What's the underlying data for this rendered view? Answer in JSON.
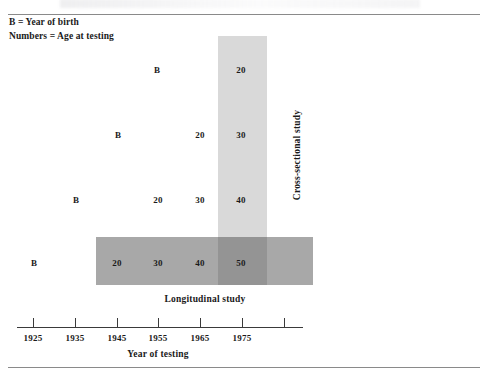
{
  "figure": {
    "legend": {
      "line1": "B = Year of birth",
      "line2": "Numbers = Age at testing"
    },
    "labels": {
      "cross_sectional": "Cross-sectional study",
      "longitudinal": "Longitudinal study",
      "axis_title": "Year of testing"
    }
  },
  "chart_data": {
    "type": "table",
    "title": "",
    "xlabel": "Year of testing",
    "ylabel": "",
    "legend_entries": [
      "B = Year of birth",
      "Numbers = Age at testing"
    ],
    "annotations": [
      "Cross-sectional study",
      "Longitudinal study"
    ],
    "axis": {
      "tick_labels": [
        "1925",
        "1935",
        "1945",
        "1955",
        "1965",
        "1975",
        ""
      ],
      "tick_values": [
        1925,
        1935,
        1945,
        1955,
        1965,
        1975,
        1985
      ],
      "xlim": [
        1920,
        1990
      ],
      "grid": false
    },
    "columns": [
      "1925",
      "1935",
      "1945",
      "1955",
      "1965",
      "1975"
    ],
    "rows": [
      {
        "birth_year": 1955,
        "cells": [
          "",
          "",
          "",
          "B",
          "",
          "20"
        ]
      },
      {
        "birth_year": 1945,
        "cells": [
          "",
          "",
          "B",
          "",
          "20",
          "30"
        ]
      },
      {
        "birth_year": 1935,
        "cells": [
          "",
          "B",
          "",
          "20",
          "30",
          "40"
        ]
      },
      {
        "birth_year": 1925,
        "cells": [
          "B",
          "",
          "20",
          "30",
          "40",
          "50"
        ]
      }
    ],
    "highlight": {
      "cross_sectional_column": "1975",
      "cross_sectional_values": [
        20,
        30,
        40,
        50
      ],
      "longitudinal_row": 1925,
      "longitudinal_values": [
        20,
        30,
        40,
        50
      ]
    }
  },
  "cells": [
    {
      "name": "cell-r1-b",
      "text": "B",
      "x": 157,
      "y": 70
    },
    {
      "name": "cell-r1-20",
      "text": "20",
      "x": 241,
      "y": 70
    },
    {
      "name": "cell-r2-b",
      "text": "B",
      "x": 118,
      "y": 135
    },
    {
      "name": "cell-r2-20",
      "text": "20",
      "x": 200,
      "y": 135
    },
    {
      "name": "cell-r2-30",
      "text": "30",
      "x": 241,
      "y": 135
    },
    {
      "name": "cell-r3-b",
      "text": "B",
      "x": 76,
      "y": 200
    },
    {
      "name": "cell-r3-20",
      "text": "20",
      "x": 158,
      "y": 200
    },
    {
      "name": "cell-r3-30",
      "text": "30",
      "x": 200,
      "y": 200
    },
    {
      "name": "cell-r3-40",
      "text": "40",
      "x": 241,
      "y": 200
    },
    {
      "name": "cell-r4-b",
      "text": "B",
      "x": 34,
      "y": 263
    },
    {
      "name": "cell-r4-20",
      "text": "20",
      "x": 117,
      "y": 263
    },
    {
      "name": "cell-r4-30",
      "text": "30",
      "x": 158,
      "y": 263
    },
    {
      "name": "cell-r4-40",
      "text": "40",
      "x": 200,
      "y": 263
    },
    {
      "name": "cell-r4-50",
      "text": "50",
      "x": 241,
      "y": 263
    }
  ],
  "ticks": [
    {
      "label": "1925",
      "x": 33
    },
    {
      "label": "1935",
      "x": 75
    },
    {
      "label": "1945",
      "x": 117
    },
    {
      "label": "1955",
      "x": 158
    },
    {
      "label": "1965",
      "x": 200
    },
    {
      "label": "1975",
      "x": 242
    },
    {
      "label": "",
      "x": 284
    }
  ],
  "colors": {
    "cross_sectional_bar": "#d9d9d9",
    "longitudinal_bar": "#a8a8a8",
    "overlap": "#949494",
    "rule": "#8a8a8a",
    "axis": "#3a3a3a",
    "text": "#1a1a1a",
    "background": "#ffffff"
  }
}
